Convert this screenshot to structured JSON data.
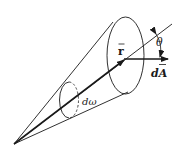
{
  "diagram": {
    "labels": {
      "r_vector": "r",
      "theta": "θ",
      "dA": "dA",
      "d_omega": "dω"
    },
    "colors": {
      "line": "#1a1a1a",
      "background": "#ffffff"
    }
  }
}
